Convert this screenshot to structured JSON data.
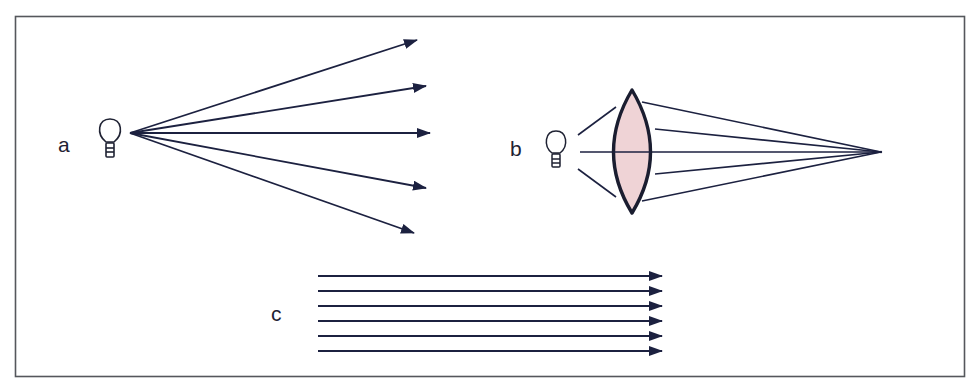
{
  "figure": {
    "frame": {
      "x": 15,
      "y": 16,
      "width": 950,
      "height": 361,
      "stroke": "#55575c"
    },
    "ray_color": "#1c2140",
    "lens_fill": "#efd3d6",
    "panels": [
      {
        "id": "a",
        "label": "a",
        "description": "Point light source emitting diverging rays",
        "source": {
          "x": 130,
          "y": 133
        },
        "ray_tips": [
          [
            417,
            40
          ],
          [
            426,
            86
          ],
          [
            430,
            133
          ],
          [
            426,
            188
          ],
          [
            414,
            233
          ]
        ]
      },
      {
        "id": "b",
        "label": "b",
        "description": "Converging lens focusing light from a bulb to a focal point",
        "lens": {
          "cx": 632,
          "top": 90,
          "bottom": 213,
          "left": 613,
          "right": 651
        },
        "focal_point": {
          "x": 881,
          "y": 152
        }
      },
      {
        "id": "c",
        "label": "c",
        "description": "Parallel rays",
        "x_start": 318,
        "x_end": 662,
        "ys": [
          276,
          291,
          306,
          321,
          336,
          351
        ]
      }
    ]
  }
}
